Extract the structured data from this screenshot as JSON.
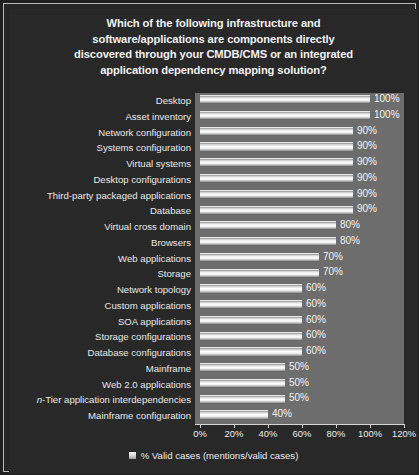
{
  "chart_data": {
    "type": "bar",
    "orientation": "horizontal",
    "title_lines": [
      "Which of the following infrastructure and",
      "software/applications are components directly",
      "discovered through your CMDB/CMS or an integrated",
      "application dependency mapping solution?"
    ],
    "categories": [
      "Desktop",
      "Asset inventory",
      "Network configuration",
      "Systems configuration",
      "Virtual systems",
      "Desktop configurations",
      "Third-party packaged applications",
      "Database",
      "Virtual cross domain",
      "Browsers",
      "Web applications",
      "Storage",
      "Network topology",
      "Custom applications",
      "SOA applications",
      "Storage configurations",
      "Database configurations",
      "Mainframe",
      "Web 2.0 applications",
      "n-Tier application interdependencies",
      "Mainframe configuration"
    ],
    "values": [
      100,
      100,
      90,
      90,
      90,
      90,
      90,
      90,
      80,
      80,
      70,
      70,
      60,
      60,
      60,
      60,
      60,
      50,
      50,
      50,
      40
    ],
    "value_labels": [
      "100%",
      "100%",
      "90%",
      "90%",
      "90%",
      "90%",
      "90%",
      "90%",
      "80%",
      "80%",
      "70%",
      "70%",
      "60%",
      "60%",
      "60%",
      "60%",
      "60%",
      "50%",
      "50%",
      "50%",
      "40%"
    ],
    "xlabel": "",
    "ylabel": "",
    "xlim": [
      0,
      120
    ],
    "xticks": [
      0,
      20,
      40,
      60,
      80,
      100,
      120
    ],
    "xtick_labels": [
      "0%",
      "20%",
      "40%",
      "60%",
      "80%",
      "100%",
      "120%"
    ],
    "grid": false,
    "legend": {
      "position": "bottom-center",
      "entries": [
        {
          "label": "% Valid cases (mentions/valid cases)",
          "swatch": "legend-swatch"
        }
      ]
    },
    "colors": {
      "chart_background": "#272727",
      "plot_background": "#6d6d6d",
      "bar_fill": "#ffffff",
      "text": "#ededed",
      "frame_border": "#b9b9b9"
    }
  }
}
